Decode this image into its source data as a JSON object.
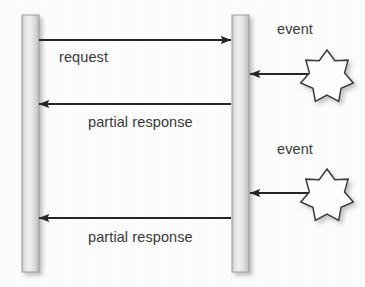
{
  "diagram": {
    "type": "uml-sequence-diagram",
    "background_color": "#fdfdfd",
    "stroke_color": "#262626",
    "text_color": "#3a3a3a",
    "lifelines": [
      {
        "id": "left-lifeline",
        "name": "left-activation-bar",
        "x": 22,
        "y": 15,
        "width": 17,
        "height": 257,
        "fill_light": "#f4f4f4",
        "fill_dark": "#b9b9b9"
      },
      {
        "id": "right-lifeline",
        "name": "right-activation-bar",
        "x": 232,
        "y": 15,
        "width": 17,
        "height": 257,
        "fill_light": "#f4f4f4",
        "fill_dark": "#b9b9b9"
      }
    ],
    "messages": [
      {
        "id": "request",
        "label": "request",
        "direction": "right",
        "x_start": 39,
        "x_end": 231,
        "y": 40,
        "label_x": 59,
        "label_y": 50
      },
      {
        "id": "partial-response-1",
        "label": "partial response",
        "direction": "left",
        "x_start": 231,
        "x_end": 39,
        "y": 104,
        "label_x": 88,
        "label_y": 115
      },
      {
        "id": "partial-response-2",
        "label": "partial response",
        "direction": "left",
        "x_start": 231,
        "x_end": 39,
        "y": 218,
        "label_x": 88,
        "label_y": 230
      }
    ],
    "events": [
      {
        "id": "event-1",
        "label": "event",
        "label_x": 277,
        "label_y": 22,
        "arrow_x_start": 309,
        "arrow_x_end": 250,
        "arrow_y": 74,
        "star_cx": 327,
        "star_cy": 77,
        "star_outer_r": 27,
        "star_inner_r": 18,
        "star_points": 7
      },
      {
        "id": "event-2",
        "label": "event",
        "label_x": 277,
        "label_y": 142,
        "arrow_x_start": 309,
        "arrow_x_end": 250,
        "arrow_y": 193,
        "star_cx": 327,
        "star_cy": 196,
        "star_outer_r": 27,
        "star_inner_r": 18,
        "star_points": 7
      }
    ]
  }
}
